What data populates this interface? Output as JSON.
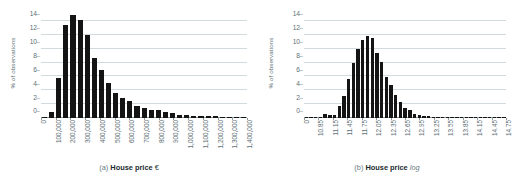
{
  "figure": {
    "background": "#ffffff",
    "bar_color": "#141414",
    "grid_color": "#d3dadd",
    "axis_text_color": "#5d7076"
  },
  "chart_data": [
    {
      "type": "bar",
      "panel": "a",
      "title": "",
      "xlabel": "House price €",
      "ylabel": "% of observations",
      "ylim": [
        0,
        15
      ],
      "yticks": [
        0,
        2,
        4,
        6,
        8,
        10,
        12,
        14
      ],
      "xtick_labels": [
        "0",
        "100,000",
        "200,000",
        "300,000",
        "400,000",
        "500,000",
        "600,000",
        "700,000",
        "800,000",
        "900,000",
        "1,000,000",
        "1,100,000",
        "1,200,000",
        "1,300,000",
        "1,400,000"
      ],
      "grid": true,
      "legend": "none",
      "bin_width": 50000,
      "categories": [
        0,
        50000,
        100000,
        150000,
        200000,
        250000,
        300000,
        350000,
        400000,
        450000,
        500000,
        550000,
        600000,
        650000,
        700000,
        750000,
        800000,
        850000,
        900000,
        950000,
        1000000,
        1050000,
        1100000,
        1150000,
        1200000,
        1250000,
        1300000,
        1350000,
        1400000
      ],
      "values": [
        0.1,
        0.9,
        5.8,
        13.4,
        14.9,
        14.1,
        12.0,
        8.7,
        6.9,
        5.0,
        3.6,
        2.9,
        2.4,
        1.8,
        1.5,
        1.2,
        1.1,
        0.8,
        0.7,
        0.45,
        0.4,
        0.3,
        0.28,
        0.25,
        0.22,
        0.2,
        0.18,
        0.15,
        0.12
      ],
      "caption_prefix": "(a)",
      "caption_bold": "House price",
      "caption_suffix": "€",
      "caption_suffix_italic": false
    },
    {
      "type": "bar",
      "panel": "b",
      "title": "",
      "xlabel": "House price log",
      "ylabel": "% of observations",
      "ylim": [
        0,
        15
      ],
      "yticks": [
        0,
        2,
        4,
        6,
        8,
        10,
        12,
        14
      ],
      "xtick_labels": [
        "0",
        "10.85",
        "11.15",
        "11.45",
        "11.75",
        "12.05",
        "12.35",
        "12.65",
        "12.95",
        "13.25",
        "13.55",
        "13.85",
        "14.15",
        "14.45",
        "14.75"
      ],
      "grid": true,
      "legend": "none",
      "bin_width": 0.1,
      "categories": [
        10.55,
        10.65,
        10.75,
        10.85,
        10.95,
        11.05,
        11.15,
        11.25,
        11.35,
        11.45,
        11.55,
        11.65,
        11.75,
        11.85,
        11.95,
        12.05,
        12.15,
        12.25,
        12.35,
        12.45,
        12.55,
        12.65,
        12.75,
        12.85,
        12.95,
        13.05,
        13.15,
        13.25,
        13.35,
        13.45,
        13.55,
        13.65,
        13.75,
        13.85,
        13.95,
        14.05,
        14.15,
        14.25,
        14.35,
        14.45,
        14.55,
        14.65,
        14.75
      ],
      "values": [
        0.05,
        0.05,
        0.08,
        0.15,
        0.6,
        0.5,
        0.45,
        1.8,
        3.2,
        5.6,
        7.9,
        10.0,
        11.2,
        11.9,
        11.5,
        9.4,
        8.1,
        5.9,
        4.7,
        3.3,
        2.3,
        1.5,
        1.1,
        0.55,
        0.5,
        0.3,
        0.25,
        0.15,
        0.12,
        0.1,
        0.08,
        0.06,
        0.05,
        0.04,
        0.04,
        0.03,
        0.03,
        0.02,
        0.02,
        0.02,
        0.02,
        0.01,
        0.01
      ],
      "caption_prefix": "(b)",
      "caption_bold": "House price",
      "caption_suffix": "log",
      "caption_suffix_italic": true
    }
  ]
}
